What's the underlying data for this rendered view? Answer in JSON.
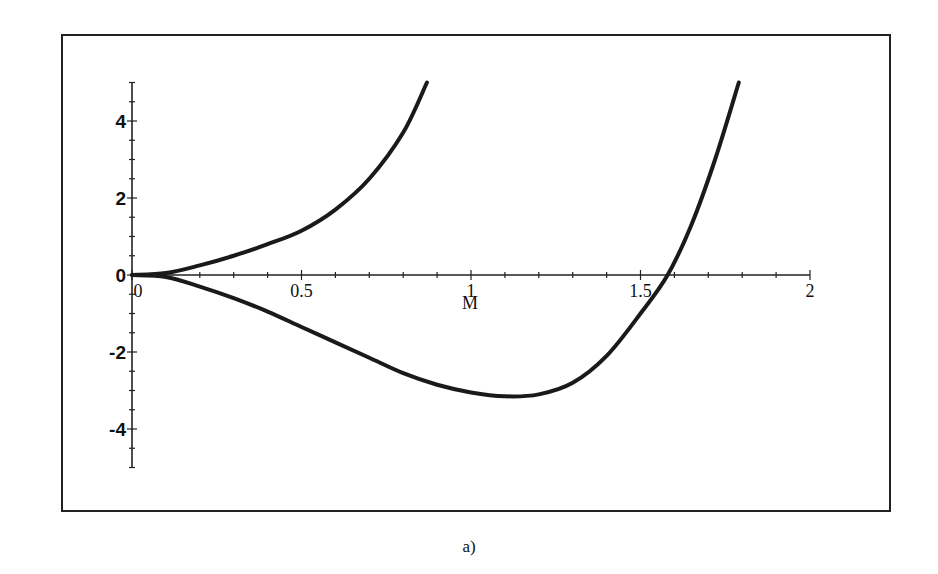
{
  "caption": "a)",
  "chart_data": {
    "type": "line",
    "title": "",
    "xlabel": "M",
    "ylabel": "",
    "xlim": [
      0,
      2
    ],
    "ylim": [
      -5,
      5
    ],
    "grid": false,
    "legend": null,
    "x_ticks": [
      {
        "value": 0,
        "label": "0"
      },
      {
        "value": 0.5,
        "label": "0.5"
      },
      {
        "value": 1,
        "label": "1"
      },
      {
        "value": 1.5,
        "label": "1.5"
      },
      {
        "value": 2,
        "label": "2"
      }
    ],
    "y_ticks": [
      {
        "value": 4,
        "label": "4"
      },
      {
        "value": 2,
        "label": "2"
      },
      {
        "value": 0,
        "label": "0"
      },
      {
        "value": -2,
        "label": "-2"
      },
      {
        "value": -4,
        "label": "-4"
      }
    ],
    "series": [
      {
        "name": "upper branch",
        "x": [
          0,
          0.1,
          0.2,
          0.3,
          0.4,
          0.5,
          0.6,
          0.7,
          0.8,
          0.87
        ],
        "y": [
          0,
          0.05,
          0.25,
          0.5,
          0.8,
          1.15,
          1.7,
          2.5,
          3.7,
          5.0
        ]
      },
      {
        "name": "lower branch",
        "x": [
          0,
          0.1,
          0.2,
          0.3,
          0.4,
          0.5,
          0.6,
          0.7,
          0.8,
          0.9,
          1.0,
          1.1,
          1.2,
          1.3,
          1.4,
          1.5,
          1.58,
          1.65,
          1.72,
          1.79
        ],
        "y": [
          0,
          -0.05,
          -0.3,
          -0.6,
          -0.95,
          -1.35,
          -1.75,
          -2.15,
          -2.55,
          -2.85,
          -3.05,
          -3.15,
          -3.1,
          -2.8,
          -2.1,
          -1.0,
          0,
          1.3,
          3.0,
          5.0
        ]
      }
    ]
  }
}
